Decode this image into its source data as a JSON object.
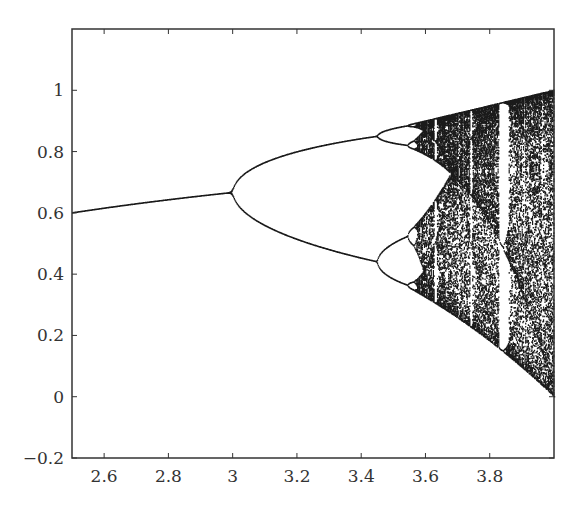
{
  "chart_data": {
    "type": "scatter",
    "title": "",
    "subtitle": "",
    "xlabel": "",
    "ylabel": "",
    "xlim": [
      2.5,
      4.0
    ],
    "ylim": [
      -0.2,
      1.2
    ],
    "xticks": [
      2.6,
      2.8,
      3.0,
      3.2,
      3.4,
      3.6,
      3.8
    ],
    "xtick_labels": [
      "2.6",
      "2.8",
      "3",
      "3.2",
      "3.4",
      "3.6",
      "3.8"
    ],
    "yticks": [
      -0.2,
      0,
      0.2,
      0.4,
      0.6,
      0.8,
      1.0
    ],
    "ytick_labels": [
      "−0.2",
      "0",
      "0.2",
      "0.4",
      "0.6",
      "0.8",
      "1"
    ],
    "grid": false,
    "legend": null,
    "series": [
      {
        "name": "logistic map attractor",
        "color": "#1a1a1a",
        "r_start": 2.5,
        "r_end": 4.0,
        "r_steps": 700,
        "transient_iterations": 300,
        "plotted_iterations": 120,
        "x0": 0.5
      }
    ],
    "key_points": [
      {
        "r": 2.5,
        "x": 0.6,
        "note": "stable fixed point"
      },
      {
        "r": 3.0,
        "x": 0.667,
        "note": "first period-doubling bifurcation"
      },
      {
        "r": 3.449,
        "x": [
          0.44,
          0.852
        ],
        "note": "period-4 onset"
      },
      {
        "r": 3.57,
        "x": "chaos onset"
      },
      {
        "r": 3.83,
        "note": "period-3 window (white band)"
      },
      {
        "r": 4.0,
        "x": [
          0.0,
          1.0
        ],
        "note": "full chaos"
      }
    ]
  },
  "axes": {
    "frame_color": "#333333",
    "background": "#ffffff"
  }
}
